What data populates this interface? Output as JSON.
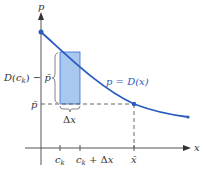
{
  "diagram": {
    "type": "demand-curve-riemann-strip",
    "axes": {
      "x_label": "x",
      "y_label": "p"
    },
    "curve": {
      "label": "p = D(x)",
      "color": "#2a5bbf"
    },
    "strip": {
      "fill": "#a9c8ef",
      "stroke": "#3d6fd0",
      "width_label": "Δx",
      "height_label": "D(c_k) − p̄"
    },
    "equilibrium": {
      "price_label": "p̄",
      "quantity_label": "x̄"
    },
    "x_ticks": [
      {
        "label": "c_k"
      },
      {
        "label": "c_k + Δx"
      },
      {
        "label": "x̄"
      }
    ],
    "colors": {
      "axis": "#555555",
      "dash": "#555555",
      "curve": "#2a5bbf",
      "strip_fill": "#a9c8ef"
    }
  }
}
